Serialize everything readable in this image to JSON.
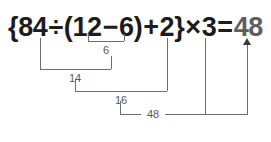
{
  "diagram": {
    "equation": {
      "open_brace": "{",
      "dividend": "84",
      "divide_sign": "÷",
      "open_paren": "(",
      "minuend": "12",
      "minus_sign": "−",
      "subtrahend": "6",
      "close_paren": ")",
      "plus_sign": "+",
      "addend": "2",
      "close_brace": "}",
      "times_sign": "×",
      "multiplier": "3",
      "equals_sign": "=",
      "result": "48"
    },
    "steps": [
      {
        "id": "step-1",
        "label": "6",
        "operation": "12 − 6"
      },
      {
        "id": "step-2",
        "label": "14",
        "operation": "84 ÷ 6"
      },
      {
        "id": "step-3",
        "label": "16",
        "operation": "14 + 2"
      },
      {
        "id": "step-4",
        "label": "48",
        "operation": "16 × 3"
      }
    ],
    "colors": {
      "equation_text": "#1c1c1c",
      "result_text": "#5e5e5e",
      "bracket_stroke": "#6d6d6d",
      "step_label_text": "#58585a",
      "arrow_fill": "#3a3a3a",
      "background": "#ffffff"
    }
  }
}
